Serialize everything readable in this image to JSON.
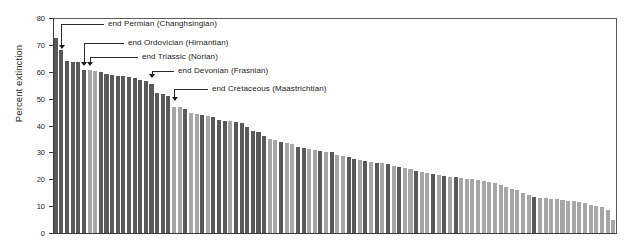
{
  "chart_data": {
    "type": "bar",
    "title": "",
    "subtitle": "",
    "xlabel": "",
    "ylabel": "Percent extinction",
    "ylim": [
      0,
      80
    ],
    "yticks": [
      0,
      10,
      20,
      30,
      40,
      50,
      60,
      70,
      80
    ],
    "ytick_labels": [
      "0",
      "10",
      "20",
      "30",
      "40",
      "50",
      "60",
      "70",
      "80"
    ],
    "xticks": [],
    "xtick_labels": [],
    "grid": false,
    "legend": null,
    "bar_color_dark": "#595959",
    "bar_color_light": "#a6a6a6",
    "axis_color": "#3a3a3a",
    "frame": "top-right",
    "categories": [
      "b1",
      "b2",
      "b3",
      "b4",
      "b5",
      "b6",
      "b7",
      "b8",
      "b9",
      "b10",
      "b11",
      "b12",
      "b13",
      "b14",
      "b15",
      "b16",
      "b17",
      "b18",
      "b19",
      "b20",
      "b21",
      "b22",
      "b23",
      "b24",
      "b25",
      "b26",
      "b27",
      "b28",
      "b29",
      "b30",
      "b31",
      "b32",
      "b33",
      "b34",
      "b35",
      "b36",
      "b37",
      "b38",
      "b39",
      "b40",
      "b41",
      "b42",
      "b43",
      "b44",
      "b45",
      "b46",
      "b47",
      "b48",
      "b49",
      "b50",
      "b51",
      "b52",
      "b53",
      "b54",
      "b55",
      "b56",
      "b57",
      "b58",
      "b59",
      "b60",
      "b61",
      "b62",
      "b63",
      "b64",
      "b65",
      "b66",
      "b67",
      "b68",
      "b69",
      "b70",
      "b71",
      "b72",
      "b73",
      "b74",
      "b75",
      "b76",
      "b77",
      "b78",
      "b79",
      "b80",
      "b81",
      "b82",
      "b83",
      "b84",
      "b85",
      "b86",
      "b87",
      "b88",
      "b89",
      "b90",
      "b91",
      "b92",
      "b93",
      "b94",
      "b95",
      "b96",
      "b97",
      "b98",
      "b99",
      "b100"
    ],
    "values": [
      72.5,
      68.2,
      64.0,
      63.8,
      63.6,
      60.8,
      60.5,
      60.2,
      59.9,
      59.0,
      58.8,
      58.6,
      58.4,
      58.2,
      57.5,
      56.8,
      56.5,
      55.6,
      52.0,
      51.6,
      51.0,
      47.0,
      46.8,
      46.0,
      44.5,
      44.2,
      44.0,
      43.6,
      43.2,
      42.0,
      41.8,
      41.5,
      41.2,
      41.0,
      39.5,
      38.0,
      37.5,
      36.0,
      35.0,
      34.5,
      34.0,
      33.5,
      33.2,
      32.0,
      31.5,
      31.2,
      31.0,
      30.5,
      30.2,
      30.0,
      29.0,
      28.5,
      28.2,
      27.5,
      27.0,
      26.8,
      26.5,
      26.2,
      26.0,
      25.5,
      25.0,
      24.5,
      24.2,
      24.0,
      23.0,
      22.8,
      22.5,
      22.0,
      21.5,
      21.2,
      21.0,
      20.8,
      20.5,
      20.2,
      20.0,
      19.8,
      19.5,
      19.0,
      18.5,
      18.0,
      17.0,
      16.5,
      16.0,
      15.0,
      14.0,
      13.5,
      13.2,
      13.0,
      12.8,
      12.5,
      12.2,
      12.0,
      11.8,
      11.5,
      11.0,
      10.5,
      10.0,
      9.5,
      8.5,
      5.0
    ],
    "bar_shades": [
      "dark",
      "dark",
      "dark",
      "dark",
      "dark",
      "dark",
      "light",
      "light",
      "dark",
      "dark",
      "dark",
      "dark",
      "dark",
      "dark",
      "dark",
      "dark",
      "dark",
      "dark",
      "dark",
      "dark",
      "dark",
      "light",
      "light",
      "dark",
      "light",
      "light",
      "dark",
      "light",
      "dark",
      "dark",
      "dark",
      "light",
      "dark",
      "dark",
      "dark",
      "dark",
      "dark",
      "dark",
      "light",
      "light",
      "dark",
      "light",
      "light",
      "dark",
      "dark",
      "light",
      "light",
      "dark",
      "light",
      "dark",
      "light",
      "light",
      "dark",
      "dark",
      "light",
      "dark",
      "light",
      "dark",
      "light",
      "dark",
      "light",
      "dark",
      "light",
      "light",
      "dark",
      "light",
      "light",
      "dark",
      "light",
      "dark",
      "light",
      "dark",
      "light",
      "light",
      "light",
      "light",
      "light",
      "light",
      "light",
      "light",
      "light",
      "light",
      "light",
      "light",
      "light",
      "dark",
      "light",
      "light",
      "light",
      "light",
      "light",
      "light",
      "light",
      "light",
      "light",
      "light",
      "light",
      "light",
      "light",
      "light"
    ],
    "annotations": [
      {
        "label": "end Permian  (Changhsingian)",
        "target_index": 1,
        "target_value": 68.2,
        "text_x": 108,
        "text_y": 19,
        "elbow_x": 66,
        "arrow_y": 45
      },
      {
        "label": "end Ordovician  (Hirnantian)",
        "target_index": 5,
        "target_value": 60.8,
        "text_x": 128,
        "text_y": 38,
        "elbow_x": 92,
        "arrow_y": 62
      },
      {
        "label": "end Triassic (Norian)",
        "target_index": 6,
        "target_value": 60.5,
        "text_x": 142,
        "text_y": 52,
        "elbow_x": 98,
        "arrow_y": 62
      },
      {
        "label": "end Devonian  (Frasnian)",
        "target_index": 17,
        "target_value": 55.6,
        "text_x": 178,
        "text_y": 66,
        "elbow_x": 159,
        "arrow_y": 74
      },
      {
        "label": "end Cretaceous  (Maastrichtian)",
        "target_index": 21,
        "target_value": 47.0,
        "text_x": 212,
        "text_y": 84,
        "elbow_x": 180,
        "arrow_y": 97
      }
    ]
  }
}
